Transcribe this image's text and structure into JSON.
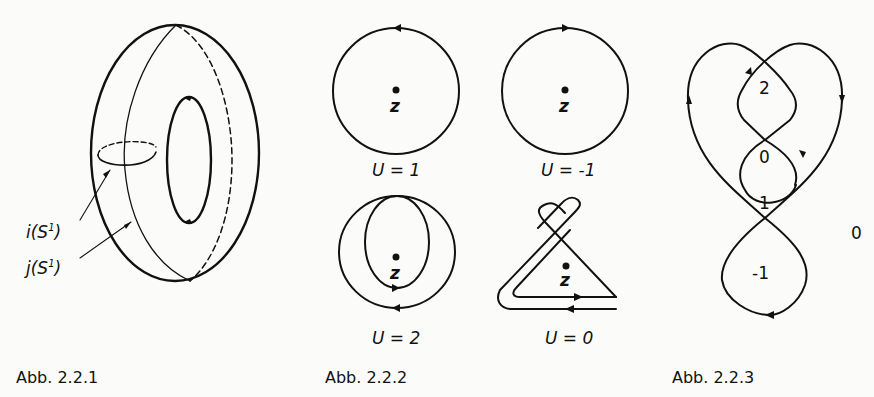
{
  "figures": [
    {
      "id": "abb-2-2-1",
      "caption": "Abb. 2.2.1",
      "description": "Torus with two embedded circles",
      "labels": {
        "i": "i(S",
        "i_sup": "1",
        "i_close": ")",
        "j": "j(S",
        "j_sup": "1",
        "j_close": ")"
      }
    },
    {
      "id": "abb-2-2-2",
      "caption": "Abb. 2.2.2",
      "description": "Winding numbers of closed curves around point z",
      "panels": [
        {
          "point": "z",
          "label": "U = 1"
        },
        {
          "point": "z",
          "label": "U = -1"
        },
        {
          "point": "z",
          "label": "U = 2"
        },
        {
          "point": "z",
          "label": "U = 0"
        }
      ]
    },
    {
      "id": "abb-2-2-3",
      "caption": "Abb. 2.2.3",
      "description": "Closed curve with region winding numbers",
      "region_labels": [
        "2",
        "0",
        "1",
        "-1",
        "0"
      ]
    }
  ]
}
